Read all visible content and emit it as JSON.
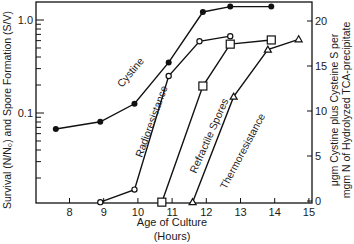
{
  "chart_data": {
    "type": "line",
    "title": "",
    "xlabel": "Age of Culture",
    "xlabel_units": "(Hours)",
    "ylabel_left": "Survival (N/N₀) and Spore Formation (S/V)",
    "ylabel_right_line1": "μgm Cystine plus Cysteine S per",
    "ylabel_right_line2": "mgm N of Hydrolyzed TCA-precipitate",
    "xlim": [
      7.0,
      15.0
    ],
    "ylim_left": [
      0.01,
      1.8
    ],
    "ylim_right": [
      0,
      22
    ],
    "yscale_left": "log",
    "yscale_right": "linear",
    "x_ticks": [
      "8",
      "9",
      "10",
      "11",
      "12",
      "13",
      "14",
      "15"
    ],
    "y_left_ticks": [
      "1.0",
      "0.1"
    ],
    "y_right_ticks": [
      "0",
      "5",
      "10",
      "15",
      "20"
    ],
    "grid": false,
    "legend": "inline labels along curves",
    "series": [
      {
        "name": "Cystine",
        "axis": "right",
        "marker": "filled-circle",
        "x": [
          7.6,
          8.9,
          9.9,
          10.9,
          11.9,
          12.7,
          13.9
        ],
        "y": [
          8.0,
          8.8,
          10.8,
          15.4,
          21.0,
          21.6,
          21.6
        ]
      },
      {
        "name": "Radioresistance",
        "axis": "left",
        "marker": "open-circle",
        "x": [
          8.9,
          9.9,
          10.9,
          11.8,
          12.7
        ],
        "y": [
          0.011,
          0.015,
          0.25,
          0.59,
          0.67
        ]
      },
      {
        "name": "Refractile Spores",
        "axis": "left",
        "marker": "open-square",
        "x": [
          10.7,
          11.9,
          12.7,
          13.9
        ],
        "y": [
          0.011,
          0.195,
          0.55,
          0.61
        ]
      },
      {
        "name": "Thermoresistance",
        "axis": "left",
        "marker": "triangle",
        "x": [
          11.6,
          12.8,
          13.8,
          14.7
        ],
        "y": [
          0.011,
          0.15,
          0.48,
          0.62
        ]
      }
    ]
  }
}
